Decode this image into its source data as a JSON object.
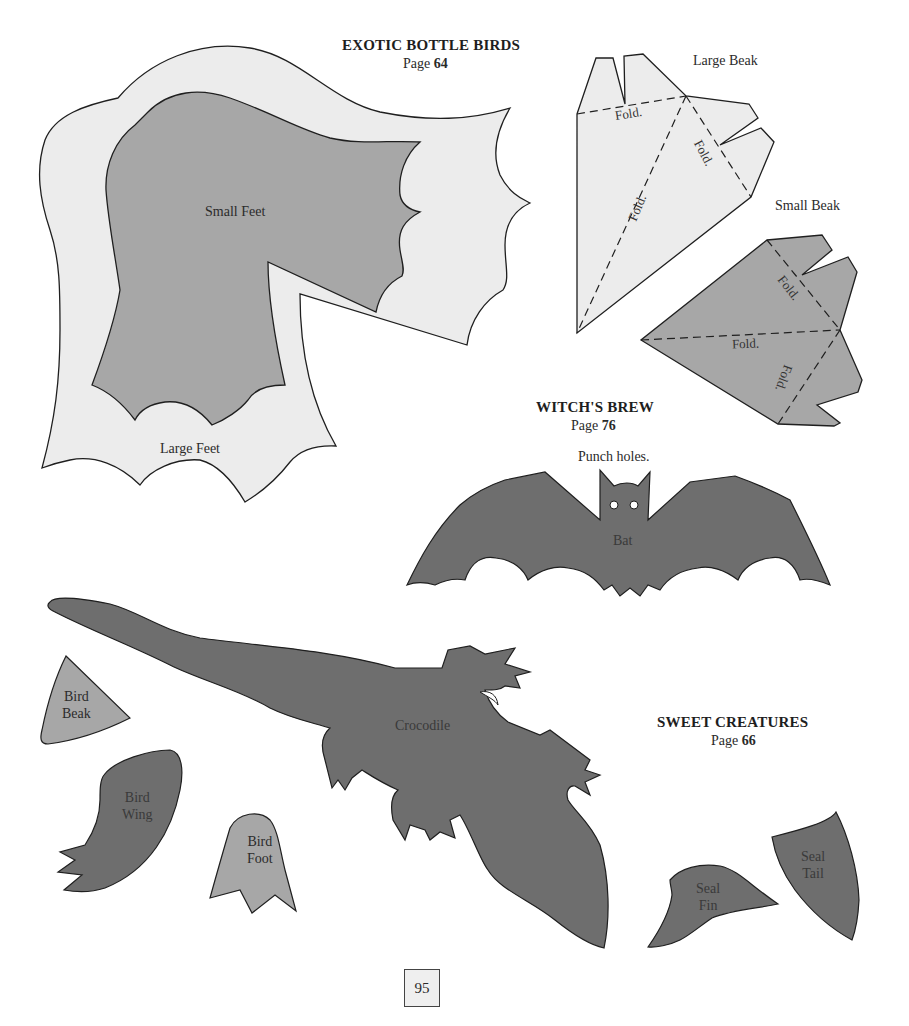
{
  "sections": {
    "exotic": {
      "title": "EXOTIC BOTTLE BIRDS",
      "page_prefix": "Page",
      "page_number": "64"
    },
    "witch": {
      "title": "WITCH'S BREW",
      "page_prefix": "Page",
      "page_number": "76"
    },
    "sweet": {
      "title": "SWEET CREATURES",
      "page_prefix": "Page",
      "page_number": "66"
    }
  },
  "patterns": {
    "large_feet": "Large Feet",
    "small_feet": "Small Feet",
    "large_beak": "Large Beak",
    "small_beak": "Small Beak",
    "fold": "Fold.",
    "punch_holes": "Punch holes.",
    "bat": "Bat",
    "crocodile": "Crocodile",
    "bird_beak": [
      "Bird",
      "Beak"
    ],
    "bird_wing": [
      "Bird",
      "Wing"
    ],
    "bird_foot": [
      "Bird",
      "Foot"
    ],
    "seal_fin": [
      "Seal",
      "Fin"
    ],
    "seal_tail": [
      "Seal",
      "Tail"
    ]
  },
  "colors": {
    "light_fill": "#ececec",
    "mid_fill": "#a7a7a7",
    "dark_fill": "#6e6e6e",
    "outline": "#1f1f1f"
  },
  "footer": {
    "page_number": "95"
  }
}
